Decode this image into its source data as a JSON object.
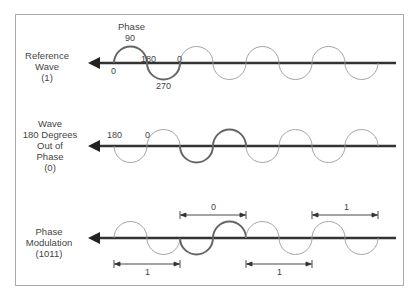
{
  "rows": [
    {
      "label": [
        "Reference",
        "Wave",
        "(1)"
      ]
    },
    {
      "label": [
        "Wave",
        "180 Degrees",
        "Out of",
        "Phase",
        "(0)"
      ]
    },
    {
      "label": [
        "Phase",
        "Modulation",
        "(1011)"
      ]
    }
  ],
  "annotations": {
    "phase_title": "Phase",
    "p90": "90",
    "p0_start": "0",
    "p180": "180",
    "p0_end": "0",
    "p270": "270",
    "w2_180": "180",
    "w2_0": "0"
  },
  "bits": {
    "top_0": "0",
    "top_1": "1",
    "bottom_1a": "1",
    "bottom_1b": "1"
  }
}
